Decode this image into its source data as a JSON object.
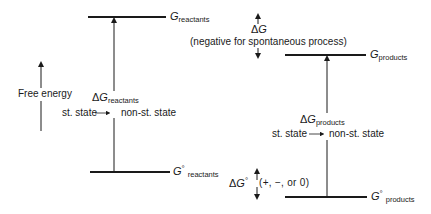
{
  "diagram": {
    "axis_label": "Free energy",
    "levels": {
      "g_reactants": {
        "symbol": "G",
        "subscript": "reactants"
      },
      "g_std_reactants": {
        "symbol": "G",
        "superscript": "°",
        "subscript": "reactants"
      },
      "g_products": {
        "symbol": "G",
        "subscript": "products"
      },
      "g_std_products": {
        "symbol": "G",
        "superscript": "°",
        "subscript": "products"
      }
    },
    "transitions": {
      "delta_g_reactants": {
        "delta": "Δ",
        "symbol": "G",
        "subscript": "reactants",
        "from": "st. state",
        "arrow": "→",
        "to": "non-st. state"
      },
      "delta_g_products": {
        "delta": "Δ",
        "symbol": "G",
        "subscript": "products",
        "from": "st. state",
        "arrow": "→",
        "to": "non-st. state"
      },
      "delta_g": {
        "delta": "Δ",
        "symbol": "G",
        "note": "(negative for spontaneous process)"
      },
      "delta_g_std": {
        "delta": "Δ",
        "symbol": "G",
        "superscript": "°",
        "note": "(+, −, or 0)"
      }
    },
    "colors": {
      "line": "#1a1a1a",
      "background": "#ffffff"
    }
  }
}
